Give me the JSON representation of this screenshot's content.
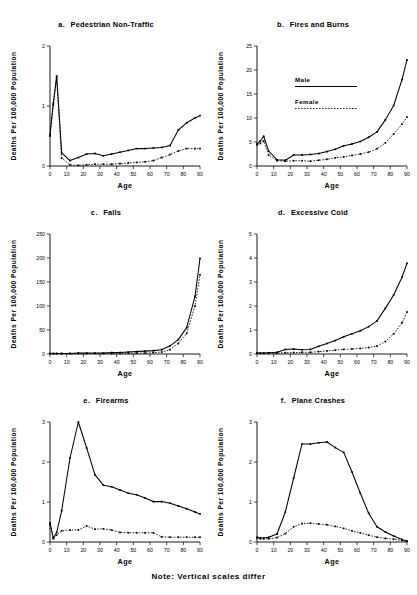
{
  "figure": {
    "note": "Note: Vertical scales differ",
    "axis": {
      "x_title": "Age",
      "y_title": "Deaths Per 100,000 Population"
    },
    "legend": {
      "male": "Male",
      "female": "Female"
    }
  },
  "chart_data": [
    {
      "id": "a",
      "type": "line",
      "title": "a.   Pedestrian Non-Traffic",
      "letter": "a.",
      "name": "Pedestrian Non-Traffic",
      "xlabel": "Age",
      "ylabel": "Deaths Per 100,000 Population",
      "xlim": [
        0,
        90
      ],
      "ylim": [
        0,
        2
      ],
      "xticks": [
        0,
        10,
        20,
        30,
        40,
        50,
        60,
        70,
        80,
        90
      ],
      "yticks": [
        0,
        1,
        2
      ],
      "ytick_labels": [
        "0",
        "1",
        "2"
      ],
      "grid": false,
      "legend_position": "none",
      "x": [
        0,
        2,
        4,
        7,
        12,
        17,
        22,
        27,
        32,
        37,
        42,
        47,
        52,
        57,
        62,
        67,
        72,
        77,
        82,
        87,
        90
      ],
      "series": [
        {
          "name": "Male",
          "style": "solid",
          "values": [
            0.52,
            1.05,
            1.5,
            0.22,
            0.09,
            0.14,
            0.2,
            0.21,
            0.17,
            0.2,
            0.23,
            0.26,
            0.29,
            0.29,
            0.3,
            0.31,
            0.34,
            0.6,
            0.72,
            0.8,
            0.84
          ]
        },
        {
          "name": "Female",
          "style": "dotted",
          "values": [
            0.5,
            1.02,
            1.47,
            0.13,
            0.02,
            0.01,
            0.02,
            0.03,
            0.03,
            0.03,
            0.04,
            0.05,
            0.06,
            0.07,
            0.09,
            0.14,
            0.19,
            0.25,
            0.29,
            0.29,
            0.29
          ]
        }
      ]
    },
    {
      "id": "b",
      "type": "line",
      "title": "b.   Fires and Burns",
      "letter": "b.",
      "name": "Fires and Burns",
      "xlabel": "Age",
      "ylabel": "Deaths Per 100,000 Population",
      "xlim": [
        0,
        90
      ],
      "ylim": [
        0,
        25
      ],
      "xticks": [
        0,
        10,
        20,
        30,
        40,
        50,
        60,
        70,
        80,
        90
      ],
      "yticks": [
        0,
        5,
        10,
        15,
        20,
        25
      ],
      "ytick_labels": [
        "0",
        "5",
        "10",
        "15",
        "20",
        "25"
      ],
      "grid": false,
      "legend_position": "inside-upper-left",
      "x": [
        0,
        2,
        4,
        7,
        12,
        17,
        22,
        27,
        32,
        37,
        42,
        47,
        52,
        57,
        62,
        67,
        72,
        77,
        82,
        87,
        90
      ],
      "series": [
        {
          "name": "Male",
          "style": "solid",
          "values": [
            4.6,
            5.2,
            6.2,
            3.1,
            1.3,
            1.2,
            2.3,
            2.3,
            2.4,
            2.6,
            3.0,
            3.5,
            4.2,
            4.6,
            5.1,
            6.0,
            7.1,
            9.6,
            12.6,
            18.0,
            22.1
          ]
        },
        {
          "name": "Female",
          "style": "dotted",
          "values": [
            4.4,
            4.7,
            5.2,
            2.3,
            1.1,
            1.0,
            1.1,
            1.1,
            1.0,
            1.2,
            1.4,
            1.7,
            1.9,
            2.2,
            2.5,
            2.9,
            3.6,
            4.8,
            6.7,
            8.7,
            10.2
          ]
        }
      ]
    },
    {
      "id": "c",
      "type": "line",
      "title": "c.   Falls",
      "letter": "c.",
      "name": "Falls",
      "xlabel": "Age",
      "ylabel": "Deaths Per 100,000 Population",
      "xlim": [
        0,
        90
      ],
      "ylim": [
        0,
        250
      ],
      "xticks": [
        0,
        10,
        20,
        30,
        40,
        50,
        60,
        70,
        80,
        90
      ],
      "yticks": [
        0,
        50,
        100,
        150,
        200,
        250
      ],
      "ytick_labels": [
        "0",
        "50",
        "100",
        "150",
        "200",
        "250"
      ],
      "grid": false,
      "legend_position": "none",
      "x": [
        0,
        2,
        4,
        7,
        12,
        17,
        22,
        27,
        32,
        37,
        42,
        47,
        52,
        57,
        62,
        67,
        72,
        77,
        82,
        87,
        90
      ],
      "series": [
        {
          "name": "Male",
          "style": "solid",
          "values": [
            1,
            1,
            1,
            1,
            1,
            2,
            2,
            2,
            2,
            3,
            3,
            4,
            5,
            6,
            7,
            9,
            17,
            30,
            55,
            120,
            199
          ]
        },
        {
          "name": "Female",
          "style": "dotted",
          "values": [
            1,
            1,
            1,
            1,
            1,
            1,
            1,
            1,
            1,
            1,
            1,
            2,
            2,
            2,
            3,
            4,
            9,
            22,
            43,
            100,
            165
          ]
        }
      ]
    },
    {
      "id": "d",
      "type": "line",
      "title": "d.   Excessive Cold",
      "letter": "d.",
      "name": "Excessive Cold",
      "xlabel": "Age",
      "ylabel": "Deaths Per 100,000 Population",
      "xlim": [
        0,
        90
      ],
      "ylim": [
        0,
        5
      ],
      "xticks": [
        0,
        10,
        20,
        30,
        40,
        50,
        60,
        70,
        80,
        90
      ],
      "yticks": [
        0,
        1,
        2,
        3,
        4,
        5
      ],
      "ytick_labels": [
        "0",
        "1",
        "2",
        "3",
        "4",
        "5"
      ],
      "grid": false,
      "legend_position": "none",
      "x": [
        0,
        2,
        4,
        7,
        12,
        17,
        22,
        27,
        32,
        37,
        42,
        47,
        52,
        57,
        62,
        67,
        72,
        77,
        82,
        87,
        90
      ],
      "series": [
        {
          "name": "Male",
          "style": "solid",
          "values": [
            0.04,
            0.04,
            0.04,
            0.05,
            0.07,
            0.19,
            0.21,
            0.18,
            0.19,
            0.32,
            0.44,
            0.56,
            0.72,
            0.84,
            0.97,
            1.14,
            1.38,
            1.9,
            2.46,
            3.2,
            3.78
          ]
        },
        {
          "name": "Female",
          "style": "dotted",
          "values": [
            0.03,
            0.03,
            0.03,
            0.03,
            0.04,
            0.05,
            0.06,
            0.07,
            0.07,
            0.1,
            0.13,
            0.16,
            0.19,
            0.21,
            0.23,
            0.27,
            0.33,
            0.52,
            0.84,
            1.3,
            1.75
          ]
        }
      ]
    },
    {
      "id": "e",
      "type": "line",
      "title": "e.   Firearms",
      "letter": "e.",
      "name": "Firearms",
      "xlabel": "Age",
      "ylabel": "Deaths Per 100,000 Population",
      "xlim": [
        0,
        90
      ],
      "ylim": [
        0,
        3
      ],
      "xticks": [
        0,
        10,
        20,
        30,
        40,
        50,
        60,
        70,
        80,
        90
      ],
      "yticks": [
        0,
        1,
        2,
        3
      ],
      "ytick_labels": [
        "0",
        "1",
        "2",
        "3"
      ],
      "grid": false,
      "legend_position": "none",
      "x": [
        0,
        2,
        4,
        7,
        12,
        17,
        22,
        27,
        32,
        37,
        42,
        47,
        52,
        57,
        62,
        67,
        72,
        77,
        82,
        87,
        90
      ],
      "series": [
        {
          "name": "Male",
          "style": "solid",
          "values": [
            0.48,
            0.1,
            0.24,
            0.78,
            2.1,
            3.0,
            2.35,
            1.68,
            1.42,
            1.38,
            1.3,
            1.22,
            1.18,
            1.1,
            1.01,
            1.01,
            0.97,
            0.9,
            0.83,
            0.75,
            0.7
          ]
        },
        {
          "name": "Female",
          "style": "dotted",
          "values": [
            0.43,
            0.08,
            0.17,
            0.28,
            0.3,
            0.3,
            0.4,
            0.32,
            0.33,
            0.3,
            0.24,
            0.23,
            0.23,
            0.23,
            0.23,
            0.13,
            0.12,
            0.12,
            0.12,
            0.12,
            0.12
          ]
        }
      ]
    },
    {
      "id": "f",
      "type": "line",
      "title": "f.   Plane Crashes",
      "letter": "f.",
      "name": "Plane Crashes",
      "xlabel": "Age",
      "ylabel": "Deaths Per 100,000 Population",
      "xlim": [
        0,
        90
      ],
      "ylim": [
        0,
        3
      ],
      "xticks": [
        0,
        10,
        20,
        30,
        40,
        50,
        60,
        70,
        80,
        90
      ],
      "yticks": [
        0,
        1,
        2,
        3
      ],
      "ytick_labels": [
        "0",
        "1",
        "2",
        "3"
      ],
      "grid": false,
      "legend_position": "none",
      "x": [
        0,
        2,
        4,
        7,
        12,
        17,
        22,
        27,
        32,
        37,
        42,
        47,
        52,
        57,
        62,
        67,
        72,
        77,
        82,
        87,
        90
      ],
      "series": [
        {
          "name": "Male",
          "style": "solid",
          "values": [
            0.12,
            0.1,
            0.1,
            0.12,
            0.2,
            0.75,
            1.6,
            2.45,
            2.45,
            2.48,
            2.5,
            2.36,
            2.24,
            1.75,
            1.22,
            0.72,
            0.38,
            0.25,
            0.15,
            0.06,
            0.02
          ]
        },
        {
          "name": "Female",
          "style": "dotted",
          "values": [
            0.1,
            0.08,
            0.08,
            0.08,
            0.11,
            0.21,
            0.38,
            0.46,
            0.47,
            0.45,
            0.43,
            0.39,
            0.34,
            0.28,
            0.23,
            0.17,
            0.12,
            0.09,
            0.07,
            0.04,
            0.02
          ]
        }
      ]
    }
  ]
}
